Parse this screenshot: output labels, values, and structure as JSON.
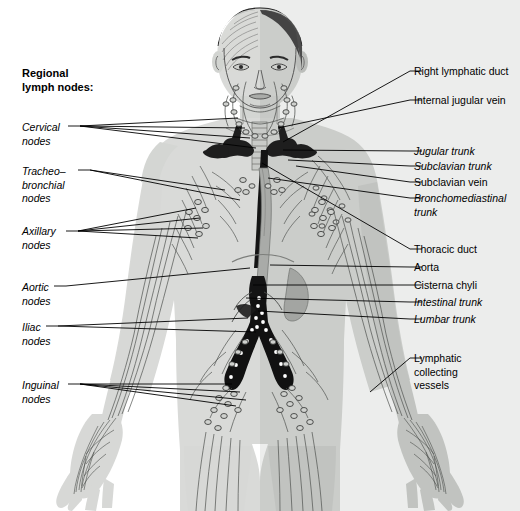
{
  "figure": {
    "title": "Regional lymph nodes:",
    "colors": {
      "body_fill": "#d9dad8",
      "body_shadow": "#b9bbb8",
      "vessel_dark": "#1a1a1a",
      "vessel_mid": "#6e7270",
      "line": "#000000",
      "background": "#ffffff",
      "hair_dark": "#4c4c4c"
    }
  },
  "left_labels": [
    {
      "id": "cervical-nodes",
      "lines": [
        "Cervical",
        "nodes"
      ],
      "style": "italic",
      "x": 22,
      "y": 121,
      "leader_x": 80,
      "leader_y": 126,
      "targets": [
        [
          238,
          118
        ],
        [
          245,
          128
        ],
        [
          250,
          138
        ],
        [
          256,
          148
        ]
      ]
    },
    {
      "id": "tracheobronchial-nodes",
      "lines": [
        "Tracheo–",
        "bronchial",
        "nodes"
      ],
      "style": "italic",
      "x": 22,
      "y": 165,
      "leader_x": 90,
      "leader_y": 170,
      "targets": [
        [
          225,
          190
        ],
        [
          240,
          200
        ]
      ]
    },
    {
      "id": "axillary-nodes",
      "lines": [
        "Axillary",
        "nodes"
      ],
      "style": "italic",
      "x": 22,
      "y": 225,
      "leader_x": 78,
      "leader_y": 231,
      "targets": [
        [
          196,
          208
        ],
        [
          200,
          218
        ],
        [
          203,
          228
        ],
        [
          198,
          238
        ]
      ]
    },
    {
      "id": "aortic-nodes",
      "lines": [
        "Aortic",
        "nodes"
      ],
      "style": "italic",
      "x": 22,
      "y": 281,
      "leader_x": 66,
      "leader_y": 286,
      "targets": [
        [
          250,
          268
        ]
      ]
    },
    {
      "id": "iliac-nodes",
      "lines": [
        "Iliac",
        "nodes"
      ],
      "style": "italic",
      "x": 22,
      "y": 321,
      "leader_x": 58,
      "leader_y": 326,
      "targets": [
        [
          248,
          318
        ],
        [
          256,
          332
        ]
      ]
    },
    {
      "id": "inguinal-nodes",
      "lines": [
        "Inguinal",
        "nodes"
      ],
      "style": "italic",
      "x": 22,
      "y": 379,
      "leader_x": 80,
      "leader_y": 384,
      "targets": [
        [
          232,
          384
        ],
        [
          240,
          392
        ],
        [
          246,
          400
        ],
        [
          236,
          406
        ]
      ]
    }
  ],
  "right_labels": [
    {
      "id": "right-lymphatic-duct",
      "lines": [
        "Right lymphatic duct"
      ],
      "style": "normal",
      "x": 414,
      "y": 65,
      "leader_x": 410,
      "leader_y": 71,
      "targets": [
        [
          283,
          142
        ]
      ]
    },
    {
      "id": "internal-jugular-vein",
      "lines": [
        "Internal jugular vein"
      ],
      "style": "normal",
      "x": 414,
      "y": 94,
      "leader_x": 410,
      "leader_y": 100,
      "targets": [
        [
          278,
          128
        ]
      ]
    },
    {
      "id": "jugular-trunk",
      "lines": [
        "Jugular trunk"
      ],
      "style": "italic",
      "x": 414,
      "y": 145,
      "leader_x": 410,
      "leader_y": 151,
      "targets": [
        [
          283,
          150
        ]
      ]
    },
    {
      "id": "subclavian-trunk",
      "lines": [
        "Subclavian trunk"
      ],
      "style": "italic",
      "x": 414,
      "y": 160,
      "leader_x": 410,
      "leader_y": 166,
      "targets": [
        [
          288,
          160
        ]
      ]
    },
    {
      "id": "subclavian-vein",
      "lines": [
        "Subclavian vein"
      ],
      "style": "normal",
      "x": 414,
      "y": 176,
      "leader_x": 410,
      "leader_y": 182,
      "targets": [
        [
          296,
          166
        ]
      ]
    },
    {
      "id": "bronchomediastinal-trunk",
      "lines": [
        "Bronchomediastinal",
        "trunk"
      ],
      "style": "italic",
      "x": 414,
      "y": 192,
      "leader_x": 410,
      "leader_y": 198,
      "targets": [
        [
          268,
          178
        ]
      ]
    },
    {
      "id": "thoracic-duct",
      "lines": [
        "Thoracic duct"
      ],
      "style": "normal",
      "x": 414,
      "y": 243,
      "leader_x": 410,
      "leader_y": 249,
      "targets": [
        [
          262,
          163
        ]
      ]
    },
    {
      "id": "aorta",
      "lines": [
        "Aorta"
      ],
      "style": "normal",
      "x": 414,
      "y": 261,
      "leader_x": 410,
      "leader_y": 267,
      "targets": [
        [
          270,
          265
        ]
      ]
    },
    {
      "id": "cisterna-chyli",
      "lines": [
        "Cisterna chyli"
      ],
      "style": "normal",
      "x": 414,
      "y": 279,
      "leader_x": 410,
      "leader_y": 285,
      "targets": [
        [
          253,
          285
        ]
      ]
    },
    {
      "id": "intestinal-trunk",
      "lines": [
        "Intestinal trunk"
      ],
      "style": "italic",
      "x": 414,
      "y": 296,
      "leader_x": 410,
      "leader_y": 302,
      "targets": [
        [
          246,
          298
        ]
      ]
    },
    {
      "id": "lumbar-trunk",
      "lines": [
        "Lumbar trunk"
      ],
      "style": "italic",
      "x": 414,
      "y": 313,
      "leader_x": 410,
      "leader_y": 319,
      "targets": [
        [
          258,
          311
        ]
      ]
    },
    {
      "id": "lymphatic-collecting-vessels",
      "lines": [
        "Lymphatic",
        "collecting",
        "vessels"
      ],
      "style": "normal",
      "x": 414,
      "y": 352,
      "leader_x": 410,
      "leader_y": 358,
      "targets": [
        [
          370,
          392
        ]
      ]
    }
  ]
}
